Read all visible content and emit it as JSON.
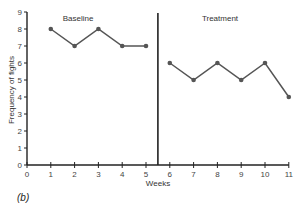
{
  "chart_data": {
    "type": "line",
    "title": "",
    "xlabel": "Weeks",
    "ylabel": "Frequency of fights",
    "xlim": [
      0,
      11
    ],
    "ylim": [
      0,
      9
    ],
    "x_ticks": [
      0,
      1,
      2,
      3,
      4,
      5,
      6,
      7,
      8,
      9,
      10,
      11
    ],
    "y_ticks": [
      0,
      1,
      2,
      3,
      4,
      5,
      6,
      7,
      8,
      9
    ],
    "grid": false,
    "legend": null,
    "phase_change_line_x": 5.5,
    "series": [
      {
        "name": "Baseline",
        "x": [
          1,
          2,
          3,
          4,
          5
        ],
        "values": [
          8,
          7,
          8,
          7,
          7
        ]
      },
      {
        "name": "Treatment",
        "x": [
          6,
          7,
          8,
          9,
          10,
          11
        ],
        "values": [
          6,
          5,
          6,
          5,
          6,
          4
        ]
      }
    ],
    "annotations": [
      "Baseline",
      "Treatment"
    ],
    "panel_label": "(b)"
  },
  "labels": {
    "baseline": "Baseline",
    "treatment": "Treatment",
    "xlabel": "Weeks",
    "ylabel": "Frequency of fights",
    "panel": "(b)"
  },
  "colors": {
    "axis": "#222222",
    "line": "#555555",
    "marker": "#555555"
  }
}
